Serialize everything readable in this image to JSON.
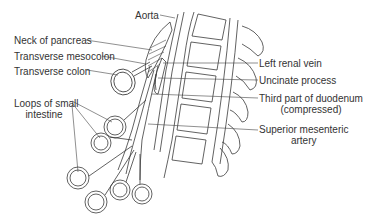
{
  "diagram": {
    "labels": {
      "aorta": "Aorta",
      "neck_of_pancreas": "Neck of pancreas",
      "transverse_mesocolon": "Transverse mesocolon",
      "transverse_colon": "Transverse colon",
      "loops_small_intestine_line1": "Loops of small",
      "loops_small_intestine_line2": "intestine",
      "left_renal_vein": "Left renal vein",
      "uncinate_process": "Uncinate process",
      "third_part_duodenum_line1": "Third part of duodenum",
      "third_part_duodenum_line2": "(compressed)",
      "sma_line1": "Superior mesenteric",
      "sma_line2": "artery"
    },
    "colors": {
      "ink": "#3a3a3a",
      "text": "#333333",
      "background": "#ffffff"
    }
  }
}
